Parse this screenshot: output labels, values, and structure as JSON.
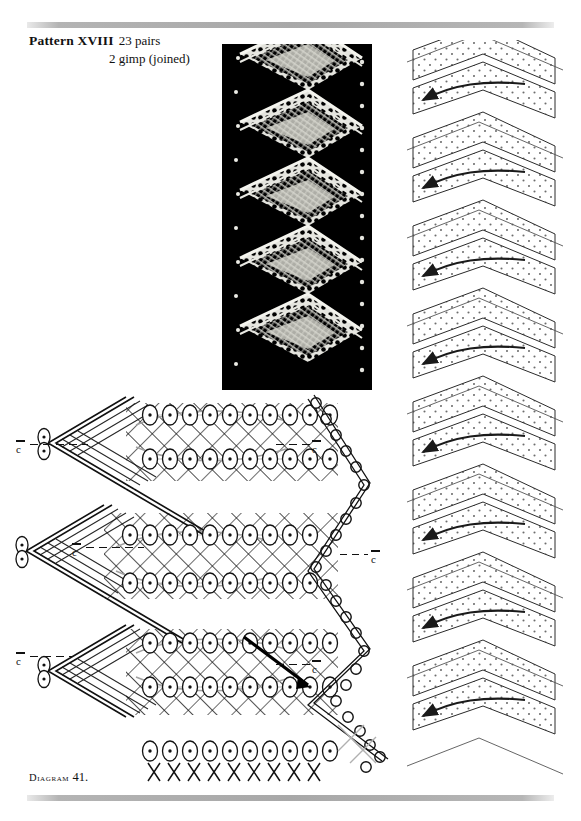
{
  "page": {
    "width": 581,
    "height": 821,
    "background": "#ffffff",
    "ink": "#111111"
  },
  "heading": {
    "pattern_label": "Pattern XVIII",
    "pairs": "23 pairs",
    "gimp": "2 gimp (joined)"
  },
  "caption": {
    "prefix": "Diagram",
    "number": "41."
  },
  "figures": {
    "photograph": {
      "name": "lace-sample-photograph",
      "description": "Black and white photograph of worked bobbin lace edging",
      "background": "#000000",
      "thread": "#f2f2ee",
      "zigzag_repeats": 5
    },
    "pricking": {
      "name": "pricking-diagram",
      "description": "Chevron pricking with pin-hole dot grid and direction arrows",
      "stroke": "#1a1a1a",
      "dot": "#6b6b6b",
      "chevron_repeats": 8
    },
    "working": {
      "name": "working-diagram",
      "description": "Thread-by-thread working diagram of the zigzag repeat",
      "stroke": "#111111",
      "gimp": "#9a9a9a"
    }
  },
  "guide_marks": [
    {
      "label": "c",
      "side": "left",
      "x": 16,
      "y": 440
    },
    {
      "label": "c",
      "side": "right",
      "x": 312,
      "y": 440
    },
    {
      "label": "c",
      "side": "left",
      "x": 72,
      "y": 543
    },
    {
      "label": "c",
      "side": "right",
      "x": 371,
      "y": 550
    },
    {
      "label": "c",
      "side": "left",
      "x": 16,
      "y": 652
    },
    {
      "label": "c",
      "side": "right",
      "x": 312,
      "y": 660
    }
  ]
}
